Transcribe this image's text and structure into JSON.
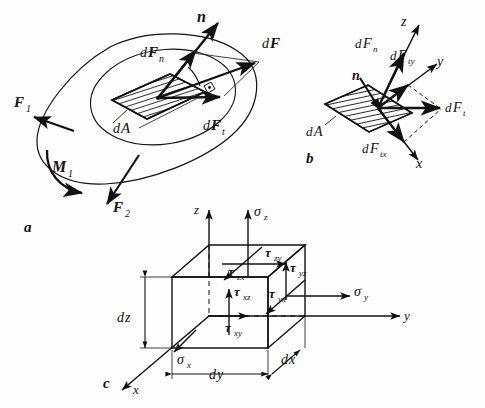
{
  "figure": {
    "background_color": "#fdfdfd",
    "ink_color": "#111111",
    "panels": [
      {
        "id": "a",
        "label": "a",
        "caption": "Body cut by a section plane with resultant force dF on area element dA"
      },
      {
        "id": "b",
        "label": "b",
        "caption": "Decomposition of dF into normal and tangential components in x,y,z"
      },
      {
        "id": "c",
        "label": "c",
        "caption": "Volume element dx dy dz with normal and shear stresses"
      }
    ]
  },
  "panel_a": {
    "panel_label": "a",
    "external_force_1": "F",
    "external_force_1_sub": "1",
    "external_force_2": "F",
    "external_force_2_sub": "2",
    "moment": "M",
    "moment_sub": "1",
    "normal_vector": "n",
    "area_element_d": "d",
    "area_element": "A",
    "force_total_d": "d",
    "force_total": "F",
    "force_normal_d": "d",
    "force_normal": "F",
    "force_normal_sub": "n",
    "force_tangential_d": "d",
    "force_tangential": "F",
    "force_tangential_sub": "t"
  },
  "panel_b": {
    "panel_label": "b",
    "axis_x": "x",
    "axis_y": "y",
    "axis_z": "z",
    "normal_vector": "n",
    "area_element_d": "d",
    "area_element": "A",
    "force_normal_d": "d",
    "force_normal": "F",
    "force_normal_sub": "n",
    "force_tangential_d": "d",
    "force_tangential": "F",
    "force_tangential_sub": "t",
    "force_tang_x_d": "d",
    "force_tang_x": "F",
    "force_tang_x_sub": "tx",
    "force_tang_y_d": "d",
    "force_tang_y": "F",
    "force_tang_y_sub": "ty"
  },
  "panel_c": {
    "panel_label": "c",
    "axis_x": "x",
    "axis_y": "y",
    "axis_z": "z",
    "sigma_x": "σ",
    "sigma_x_sub": "x",
    "sigma_y": "σ",
    "sigma_y_sub": "y",
    "sigma_z": "σ",
    "sigma_z_sub": "z",
    "tau_xy": "τ",
    "tau_xy_sub": "xy",
    "tau_xz": "τ",
    "tau_xz_sub": "xz",
    "tau_yx": "τ",
    "tau_yx_sub": "yx",
    "tau_yz": "τ",
    "tau_yz_sub": "yz",
    "tau_zx": "τ",
    "tau_zx_sub": "zx",
    "tau_zy": "τ",
    "tau_zy_sub": "zy",
    "dim_dx_d": "d",
    "dim_dx": "x",
    "dim_dy_d": "d",
    "dim_dy": "y",
    "dim_dz_d": "d",
    "dim_dz": "z"
  }
}
